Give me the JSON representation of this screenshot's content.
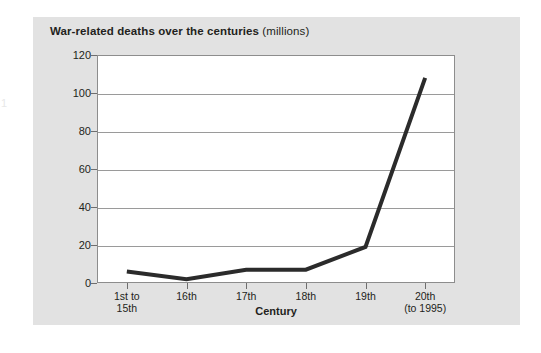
{
  "page": {
    "margin_mark": "1",
    "background_color": "#ffffff",
    "card_color": "#e2e2e2"
  },
  "chart_data": {
    "type": "line",
    "title": "War-related deaths over the centuries",
    "title_unit": "(millions)",
    "xlabel": "Century",
    "ylabel": "",
    "categories": [
      "1st to\n15th",
      "16th",
      "17th",
      "18th",
      "19th",
      "20th\n(to 1995)"
    ],
    "values": [
      6,
      2,
      7,
      7,
      19,
      108
    ],
    "ylim": [
      0,
      120
    ],
    "yticks": [
      0,
      20,
      40,
      60,
      80,
      100,
      120
    ],
    "ytick_labels": [
      "0",
      "20",
      "40",
      "60",
      "80",
      "100",
      "120"
    ],
    "grid": true,
    "grid_axis": "y",
    "legend": false,
    "line_color": "#2b2b2b",
    "line_width": 4,
    "plot_background": "#ffffff",
    "grid_color": "#9a9a9a"
  }
}
